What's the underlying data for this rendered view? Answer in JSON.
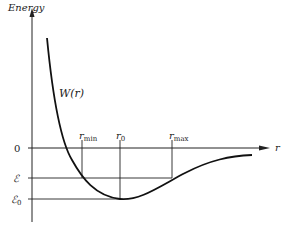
{
  "diagram": {
    "y_axis_label": "Energy",
    "x_axis_label": "r",
    "curve_label": "W(r)",
    "y_ticks": {
      "zero": "0",
      "energy": "ℰ",
      "energy0_base": "ℰ",
      "energy0_sub": "0"
    },
    "x_markers": {
      "rmin_base": "r",
      "rmin_sub": "min",
      "r0_base": "r",
      "r0_sub": "0",
      "rmax_base": "r",
      "rmax_sub": "max"
    },
    "colors": {
      "line": "#222222",
      "curve": "#111111",
      "background": "#ffffff"
    }
  }
}
